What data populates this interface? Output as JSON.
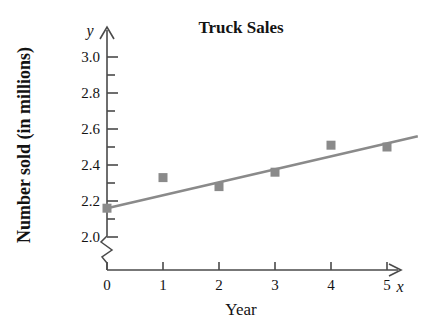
{
  "chart_data": {
    "type": "scatter",
    "title": "Truck Sales",
    "xlabel": "Year",
    "ylabel": "Number sold (in millions)",
    "x_axis_variable": "x",
    "y_axis_variable": "y",
    "x": [
      0,
      1,
      2,
      3,
      4,
      5
    ],
    "values": [
      2.16,
      2.33,
      2.28,
      2.36,
      2.51,
      2.5
    ],
    "xlim": [
      0,
      5
    ],
    "ylim": [
      2.0,
      3.0
    ],
    "x_tick_labels": [
      "0",
      "1",
      "2",
      "3",
      "4",
      "5"
    ],
    "y_tick_labels": [
      "2.0",
      "2.2",
      "2.4",
      "2.6",
      "2.8",
      "3.0"
    ],
    "y_tick_values": [
      2.0,
      2.2,
      2.4,
      2.6,
      2.8,
      3.0
    ],
    "y_minor_tick_values": [
      2.1,
      2.3,
      2.5,
      2.7,
      2.9
    ],
    "y_axis_break": true,
    "y_axis_break_note": "zigzag break below 2.0",
    "grid": false,
    "legend": "none",
    "series": [
      {
        "name": "Truck sales data points",
        "marker": "square",
        "color": "#8a8a8a",
        "points": [
          {
            "x": 0,
            "y": 2.16
          },
          {
            "x": 1,
            "y": 2.33
          },
          {
            "x": 2,
            "y": 2.28
          },
          {
            "x": 3,
            "y": 2.36
          },
          {
            "x": 4,
            "y": 2.51
          },
          {
            "x": 5,
            "y": 2.5
          }
        ]
      },
      {
        "name": "Line of best fit",
        "marker": "none",
        "color": "#8a8a8a",
        "endpoints": [
          {
            "x": 0,
            "y": 2.16
          },
          {
            "x": 5.55,
            "y": 2.56
          }
        ],
        "slope": 0.072,
        "intercept": 2.16
      }
    ],
    "colors": {
      "marker": "#8a8a8a",
      "line": "#8a8a8a",
      "axis": "#4a4a4a",
      "text": "#131313",
      "background": "#ffffff"
    }
  }
}
